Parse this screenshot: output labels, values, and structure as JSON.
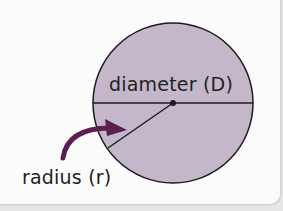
{
  "diagram": {
    "labels": {
      "diameter": "diameter (D)",
      "radius": "radius (r)"
    },
    "colors": {
      "circle_fill": "#c4b7c9",
      "outline": "#1e1a1f",
      "arrow": "#5b1f50",
      "background": "#fbfbfc"
    }
  }
}
